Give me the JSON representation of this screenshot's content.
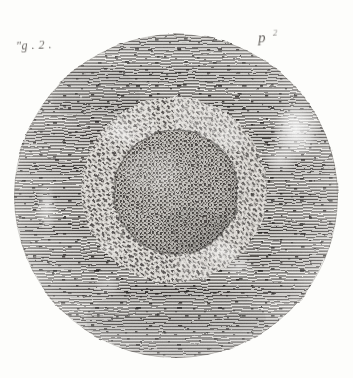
{
  "plate": {
    "kind": "engraving",
    "background_color": "#fdfdfb",
    "ink_color": "#2b2724",
    "caption_color": "#4a4642",
    "labels": {
      "figure": "\"g . 2 .",
      "specimen": "p",
      "specimen_superscript": "2"
    },
    "field": {
      "shape": "circle",
      "center_x": 176,
      "center_y": 196,
      "radius": 162,
      "hatching": "horizontal-line",
      "description": "circular microscope field of view rendered in horizontal line engraving with dark stipple flecks"
    },
    "corona_ring": {
      "shape": "annulus",
      "center_x": 174,
      "center_y": 190,
      "outer_radius": 92,
      "inner_radius": 62,
      "hatching": "radial-dash",
      "description": "granular corona ring of short radial dashes surrounding the central disc"
    },
    "central_disc": {
      "shape": "circle",
      "center_x": 176,
      "center_y": 192,
      "radius": 62,
      "hatching": "cross-stipple",
      "description": "central ovum-like disc with fine cross-stippled texture"
    },
    "highlights": [
      {
        "name": "upper-right-highlight",
        "cx": 296,
        "cy": 131,
        "rx": 22,
        "ry": 28
      },
      {
        "name": "left-rim-highlight",
        "cx": 48,
        "cy": 208,
        "rx": 10,
        "ry": 22
      },
      {
        "name": "lower-right-highlight",
        "cx": 236,
        "cy": 268,
        "rx": 16,
        "ry": 12
      }
    ]
  }
}
